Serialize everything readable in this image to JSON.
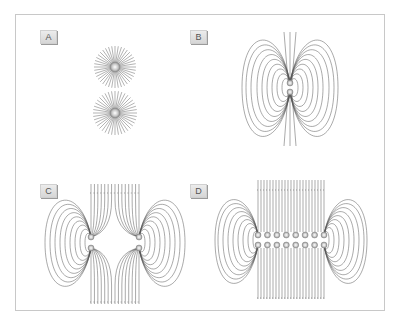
{
  "figure": {
    "panels": [
      {
        "id": "A",
        "label": "A",
        "description": "Two isolated charges with radial field lines"
      },
      {
        "id": "B",
        "label": "B",
        "description": "Single dipole field lines (charge pair)"
      },
      {
        "id": "C",
        "label": "C",
        "description": "Two separated dipoles with field lines"
      },
      {
        "id": "D",
        "label": "D",
        "description": "Row of eight dipoles with parallel field lines"
      }
    ],
    "colors": {
      "frame": "#c8c8c8",
      "field_line": "#555555",
      "charge_fill": "#bbbbbb",
      "label_bg": "#e0e0e0"
    }
  }
}
